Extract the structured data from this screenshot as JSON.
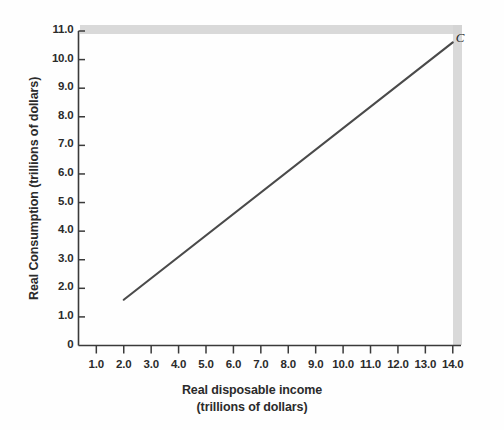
{
  "chart_data": {
    "type": "line",
    "title": "",
    "xlabel": "Real disposable income",
    "xlabel_line2": "(trillions of dollars)",
    "ylabel": "Real Consumption (trillions of dollars)",
    "xlim": [
      0.35,
      14.3
    ],
    "ylim": [
      0,
      11.0
    ],
    "grid": false,
    "legend_position": "none",
    "xticks": [
      "1.0",
      "2.0",
      "3.0",
      "4.0",
      "5.0",
      "6.0",
      "7.0",
      "8.0",
      "9.0",
      "10.0",
      "11.0",
      "12.0",
      "13.0",
      "14.0"
    ],
    "xtick_values": [
      1.0,
      2.0,
      3.0,
      4.0,
      5.0,
      6.0,
      7.0,
      8.0,
      9.0,
      10.0,
      11.0,
      12.0,
      13.0,
      14.0
    ],
    "yticks": [
      "0",
      "1.0",
      "2.0",
      "3.0",
      "4.0",
      "5.0",
      "6.0",
      "7.0",
      "8.0",
      "9.0",
      "10.0",
      "11.0"
    ],
    "ytick_values": [
      0,
      1.0,
      2.0,
      3.0,
      4.0,
      5.0,
      6.0,
      7.0,
      8.0,
      9.0,
      10.0,
      11.0
    ],
    "series": [
      {
        "name": "C",
        "annotation": "C",
        "color": "#4a4a4a",
        "x": [
          2.0,
          14.0
        ],
        "values": [
          1.6,
          10.6
        ]
      }
    ],
    "annotations": [
      {
        "text": "C",
        "x": 14.0,
        "y": 10.75
      }
    ]
  },
  "colors": {
    "axis": "#3a3a3a",
    "line": "#4f4f4f",
    "text": "#2b2b2b",
    "shadow": "#cfcfcf",
    "background": "#fefefe"
  }
}
